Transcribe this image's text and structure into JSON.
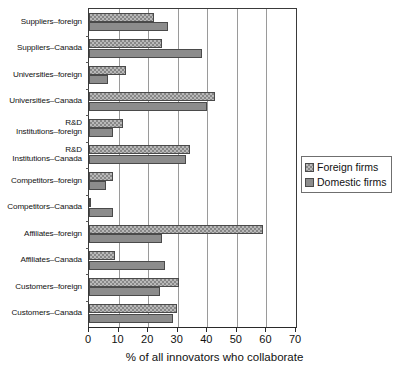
{
  "chart_data": {
    "type": "bar",
    "orientation": "horizontal",
    "title": "",
    "xlabel": "% of all innovators who collaborate",
    "ylabel": "",
    "xlim": [
      0,
      70
    ],
    "xticks": [
      0,
      10,
      20,
      30,
      40,
      50,
      60,
      70
    ],
    "grid": "vertical",
    "legend_position": "center-right",
    "categories": [
      "Suppliers–foreign",
      "Suppliers–Canada",
      "Universities–foreign",
      "Universities–Canada",
      "R&D\nInstitutions–foreign",
      "R&D\nInstitutions–Canada",
      "Competitors–foreign",
      "Competitors–Canada",
      "Affiliates–foreign",
      "Affiliates–Canada",
      "Customers–foreign",
      "Customers–Canada"
    ],
    "series": [
      {
        "name": "Foreign firms",
        "color": "#b9b9b9",
        "pattern": "checkered",
        "values": [
          22.0,
          24.7,
          12.5,
          42.7,
          11.4,
          34.3,
          8.0,
          0.5,
          59.0,
          8.9,
          30.3,
          29.7
        ]
      },
      {
        "name": "Domestic firms",
        "color": "#8c8c8c",
        "pattern": "solid",
        "values": [
          26.6,
          38.2,
          6.5,
          40.0,
          8.2,
          32.8,
          5.7,
          8.0,
          24.7,
          25.8,
          24.0,
          28.3
        ]
      }
    ]
  },
  "legend": {
    "items": [
      {
        "label": "Foreign firms"
      },
      {
        "label": "Domestic firms"
      }
    ]
  }
}
